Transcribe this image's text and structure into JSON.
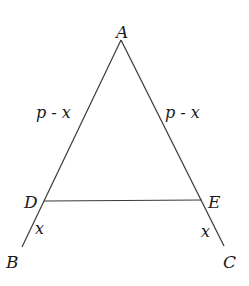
{
  "figure": {
    "type": "triangle-with-parallel-segment",
    "stroke_color": "#3a3a3a",
    "text_color": "#1a1a1a",
    "vertices": {
      "A": {
        "label": "A"
      },
      "B": {
        "label": "B"
      },
      "C": {
        "label": "C"
      },
      "D": {
        "label": "D"
      },
      "E": {
        "label": "E"
      }
    },
    "segment_labels": {
      "AD": "p - x",
      "AE": "p - x",
      "DB": "x",
      "EC": "x"
    }
  }
}
